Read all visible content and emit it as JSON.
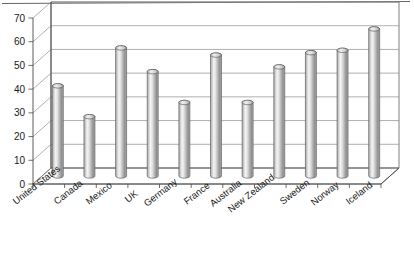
{
  "chart_data": {
    "type": "bar",
    "title": "",
    "subtitle": "",
    "xlabel": "",
    "ylabel": "",
    "categories": [
      "United States",
      "Canada",
      "Mexico",
      "UK",
      "Germany",
      "France",
      "Australia",
      "New Zealand",
      "Sweden",
      "Norway",
      "Iceland"
    ],
    "values": [
      38,
      25,
      54,
      44,
      31,
      51,
      31,
      46,
      52,
      53,
      62
    ],
    "ylim": [
      0,
      70
    ],
    "ytick_values": [
      0,
      10,
      20,
      30,
      40,
      50,
      60,
      70
    ],
    "ytick_labels": [
      "0",
      "10",
      "20",
      "30",
      "40",
      "50",
      "60",
      "70"
    ],
    "grid": true,
    "grid_axis": "y",
    "legend": false,
    "legend_position": "none",
    "style": "3d-cylinder",
    "series": [
      {
        "name": "Series 1",
        "values": [
          38,
          25,
          54,
          44,
          31,
          51,
          31,
          46,
          52,
          53,
          62
        ]
      }
    ],
    "colors": {
      "bar_light": "#f2f2f2",
      "bar_mid": "#d6d6d6",
      "bar_dark": "#8a8a8a",
      "bar_outline": "#4d4d4d",
      "gridline": "#8d8d8d",
      "axis": "#4a4a4a",
      "frame": "#555555",
      "background": "#ffffff",
      "text": "#1a1a1a"
    }
  },
  "axes": {
    "y_axis_name": "value-axis",
    "x_axis_name": "category-axis"
  }
}
